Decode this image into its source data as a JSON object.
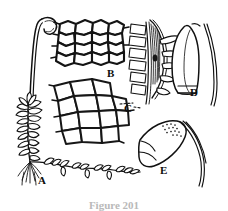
{
  "figure": {
    "caption": "Figure 201",
    "background_color": "#ffffff",
    "ink_color": "#111111",
    "labels": [
      {
        "id": "A",
        "text": "A",
        "x": 38,
        "y": 175,
        "subject": "whole-plant-habit"
      },
      {
        "id": "B",
        "text": "B",
        "x": 107,
        "y": 68,
        "subject": "upper-leaf-cells"
      },
      {
        "id": "C",
        "text": "C",
        "x": 124,
        "y": 103,
        "subject": "basal-leaf-cells"
      },
      {
        "id": "D",
        "text": "D",
        "x": 190,
        "y": 87,
        "subject": "capsule-cylindric"
      },
      {
        "id": "E",
        "text": "E",
        "x": 160,
        "y": 165,
        "subject": "capsule-ovoid"
      }
    ],
    "panels": [
      {
        "id": "A",
        "name": "whole-plant-habit",
        "description": "Leafy moss shoot with erect seta bearing a curved capsule, creeping stolon and basal rhizoids"
      },
      {
        "id": "B",
        "name": "upper-leaf-cells",
        "description": "Areolation of small rounded polygonal cells with thick walls",
        "rows": 4,
        "columns": 5
      },
      {
        "id": "C",
        "name": "basal-leaf-cells",
        "description": "Areolation of large lax polygonal cells with thin walls",
        "rows": 3,
        "columns": 4
      },
      {
        "id": "D",
        "name": "capsule-cylindric",
        "description": "Elongate cylindric capsule with operculum and a long arching seta"
      },
      {
        "id": "E",
        "name": "capsule-ovoid",
        "description": "Ovoid capsule with papillose stippling near the apex and an arching seta"
      },
      {
        "id": "leafy-stem",
        "name": "leafy-stem-side-view",
        "description": "Stem in side view with a rank of rectangular leaves and striate perichaetial bracts"
      }
    ]
  }
}
